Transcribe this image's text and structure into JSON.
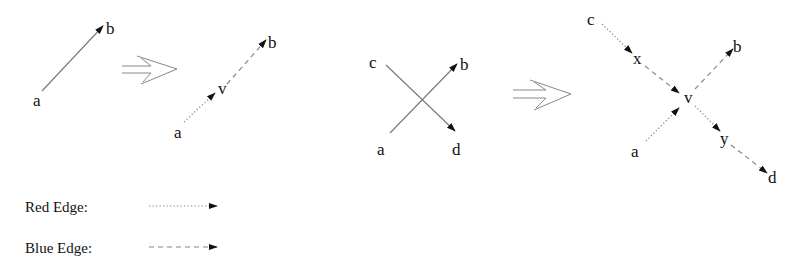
{
  "figure": {
    "colors": {
      "background": "#ffffff",
      "text": "#111111",
      "edge": "#888888",
      "arrowhead": "#111111"
    }
  },
  "panels": [
    {
      "id": "single-edge-before",
      "nodes": [
        {
          "label": "a",
          "x": 33,
          "y": 106
        },
        {
          "label": "b",
          "x": 106,
          "y": 34
        }
      ],
      "edges": [
        {
          "from": "a",
          "to": "b",
          "style": "solid",
          "x1": 42,
          "y1": 91,
          "x2": 103,
          "y2": 26
        }
      ]
    },
    {
      "id": "single-edge-after",
      "nodes": [
        {
          "label": "a",
          "x": 174,
          "y": 138
        },
        {
          "label": "v",
          "x": 218,
          "y": 94
        },
        {
          "label": "b",
          "x": 268,
          "y": 48
        }
      ],
      "edges": [
        {
          "from": "a",
          "to": "v",
          "style": "dotted",
          "type": "red",
          "x1": 184,
          "y1": 122,
          "x2": 215,
          "y2": 93
        },
        {
          "from": "v",
          "to": "b",
          "style": "dashed",
          "type": "blue",
          "x1": 227,
          "y1": 84,
          "x2": 266,
          "y2": 40
        }
      ]
    },
    {
      "id": "crossing-before",
      "nodes": [
        {
          "label": "c",
          "x": 369,
          "y": 68
        },
        {
          "label": "b",
          "x": 460,
          "y": 70
        },
        {
          "label": "a",
          "x": 377,
          "y": 155
        },
        {
          "label": "d",
          "x": 452,
          "y": 155
        }
      ],
      "edges": [
        {
          "from": "c",
          "to": "d",
          "style": "solid",
          "x1": 386,
          "y1": 65,
          "x2": 455,
          "y2": 131
        },
        {
          "from": "a",
          "to": "b",
          "style": "solid",
          "x1": 390,
          "y1": 133,
          "x2": 457,
          "y2": 64
        }
      ]
    },
    {
      "id": "crossing-after",
      "nodes": [
        {
          "label": "c",
          "x": 587,
          "y": 25
        },
        {
          "label": "x",
          "x": 633,
          "y": 64
        },
        {
          "label": "v",
          "x": 684,
          "y": 103
        },
        {
          "label": "b",
          "x": 733,
          "y": 52
        },
        {
          "label": "a",
          "x": 631,
          "y": 157
        },
        {
          "label": "y",
          "x": 720,
          "y": 144
        },
        {
          "label": "d",
          "x": 768,
          "y": 183
        }
      ],
      "edges": [
        {
          "from": "c",
          "to": "x",
          "style": "dotted",
          "type": "red",
          "x1": 602,
          "y1": 24,
          "x2": 632,
          "y2": 53
        },
        {
          "from": "x",
          "to": "v",
          "style": "dashed",
          "type": "blue",
          "x1": 645,
          "y1": 66,
          "x2": 679,
          "y2": 93
        },
        {
          "from": "a",
          "to": "v",
          "style": "dotted",
          "type": "red",
          "x1": 646,
          "y1": 141,
          "x2": 679,
          "y2": 108
        },
        {
          "from": "v",
          "to": "b",
          "style": "dashed",
          "type": "blue",
          "x1": 695,
          "y1": 89,
          "x2": 733,
          "y2": 49
        },
        {
          "from": "v",
          "to": "y",
          "style": "dotted",
          "type": "red",
          "x1": 695,
          "y1": 106,
          "x2": 720,
          "y2": 131
        },
        {
          "from": "y",
          "to": "d",
          "style": "dashed",
          "type": "blue",
          "x1": 731,
          "y1": 145,
          "x2": 767,
          "y2": 173
        }
      ]
    }
  ],
  "implication_arrows": [
    {
      "id": "implies-1",
      "shaft_x1": 122,
      "shaft_x2": 151,
      "y_top": 66,
      "y_bottom": 73,
      "tip_x": 177,
      "tip_y": 69,
      "barb_top_x": 137,
      "barb_top_y": 56,
      "barb_bottom_x": 141,
      "barb_bottom_y": 84
    },
    {
      "id": "implies-2",
      "shaft_x1": 513,
      "shaft_x2": 546,
      "y_top": 90,
      "y_bottom": 98,
      "tip_x": 571,
      "tip_y": 94,
      "barb_top_x": 530,
      "barb_top_y": 80,
      "barb_bottom_x": 534,
      "barb_bottom_y": 110
    }
  ],
  "legend": {
    "items": [
      {
        "label": "Red Edge:",
        "style": "dotted",
        "text_x": 25,
        "text_y": 212,
        "line_x1": 149,
        "line_x2": 217,
        "line_y": 206
      },
      {
        "label": "Blue Edge:",
        "style": "dashed",
        "text_x": 25,
        "text_y": 253,
        "line_x1": 149,
        "line_x2": 217,
        "line_y": 247
      }
    ]
  }
}
